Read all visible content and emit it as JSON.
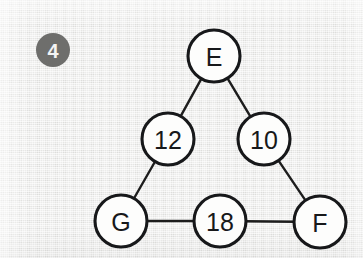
{
  "figure": {
    "badge": {
      "label": "4",
      "color": "#6e6e6c",
      "text_color": "#f4f4f4"
    },
    "background_color": "#e9e9e7",
    "node_fill": "#fdfdfc",
    "node_stroke": "#17181a",
    "edge_color": "#1d1d1d"
  },
  "graph": {
    "type": "undirected-graph",
    "nodes": [
      {
        "id": "E",
        "label": "E",
        "cx": 214,
        "cy": 56,
        "r": 26
      },
      {
        "id": "12",
        "label": "12",
        "cx": 168,
        "cy": 139,
        "r": 26
      },
      {
        "id": "10",
        "label": "10",
        "cx": 264,
        "cy": 139,
        "r": 26
      },
      {
        "id": "G",
        "label": "G",
        "cx": 121,
        "cy": 221,
        "r": 26
      },
      {
        "id": "18",
        "label": "18",
        "cx": 220,
        "cy": 221,
        "r": 26
      },
      {
        "id": "F",
        "label": "F",
        "cx": 320,
        "cy": 222,
        "r": 26
      }
    ],
    "edges": [
      {
        "from": "E",
        "to": "12"
      },
      {
        "from": "E",
        "to": "10"
      },
      {
        "from": "12",
        "to": "G"
      },
      {
        "from": "10",
        "to": "F"
      },
      {
        "from": "G",
        "to": "18"
      },
      {
        "from": "18",
        "to": "F"
      }
    ]
  }
}
